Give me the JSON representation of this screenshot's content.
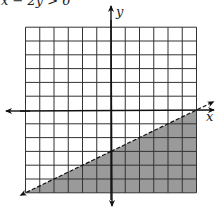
{
  "title": "x − 2y > 6",
  "chart_data": {
    "type": "area",
    "title": "x − 2y > 6",
    "xlabel": "x",
    "ylabel": "y",
    "xlim": [
      -6,
      6
    ],
    "ylim": [
      -6,
      6
    ],
    "grid": true,
    "grid_step": 1,
    "boundary": {
      "equation": "x − 2y = 6",
      "slope": 0.5,
      "intercept": -3,
      "style": "dashed",
      "points": [
        [
          -6,
          -6
        ],
        [
          6,
          0
        ]
      ]
    },
    "shaded_region": "below",
    "shade_color": "#9a9a9a",
    "series": [
      {
        "name": "boundary",
        "x": [
          -6,
          -4,
          -2,
          0,
          2,
          4,
          6
        ],
        "y": [
          -6,
          -5,
          -4,
          -3,
          -2,
          -1,
          0
        ]
      }
    ]
  },
  "colors": {
    "grid": "#333333",
    "axis": "#111111",
    "shade": "#9a9a9a"
  }
}
